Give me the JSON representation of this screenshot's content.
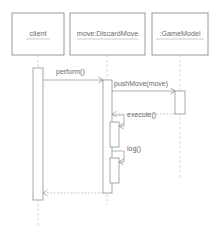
{
  "diagram": {
    "type": "uml-sequence-diagram",
    "title": "",
    "background_color": "#ffffff",
    "line_color": "#9e9e9e",
    "text_color": "#6b6b6b",
    "lifeline_color": "#c2c2c2",
    "participants": [
      {
        "id": "client",
        "label": "client",
        "underlined": true,
        "box": {
          "x": 12,
          "y": 13,
          "width": 52,
          "height": 42
        },
        "lifeline_x": 38,
        "activations": [
          {
            "x": 33,
            "y": 68,
            "width": 10,
            "height": 132
          }
        ]
      },
      {
        "id": "move-discard-move",
        "label": "move:DiscardMove",
        "underlined": true,
        "box": {
          "x": 70,
          "y": 13,
          "width": 75,
          "height": 42
        },
        "lifeline_x": 107,
        "activations": [
          {
            "x": 103,
            "y": 80,
            "width": 9,
            "height": 113
          },
          {
            "x": 110,
            "y": 122,
            "width": 9,
            "height": 25
          },
          {
            "x": 110,
            "y": 158,
            "width": 9,
            "height": 25
          }
        ]
      },
      {
        "id": "game-model",
        "label": ":GameModel",
        "underlined": true,
        "box": {
          "x": 152,
          "y": 13,
          "width": 56,
          "height": 42
        },
        "lifeline_x": 180,
        "activations": [
          {
            "x": 175,
            "y": 91,
            "width": 10,
            "height": 23
          }
        ]
      }
    ],
    "messages": [
      {
        "id": "msg-perform",
        "label": "perform()",
        "kind": "synchronous-call",
        "from": "client",
        "to": "move-discard-move",
        "direction": "right",
        "y": 80,
        "label_x": 56,
        "label_y": 72
      },
      {
        "id": "msg-pushmove",
        "label": "pushMove(move)",
        "kind": "synchronous-call",
        "from": "move-discard-move",
        "to": "game-model",
        "direction": "right",
        "y": 91,
        "label_x": 114,
        "label_y": 84
      },
      {
        "id": "msg-pushmove-return",
        "label": "",
        "kind": "return",
        "from": "game-model",
        "to": "move-discard-move",
        "direction": "left",
        "y": 114,
        "label_x": 0,
        "label_y": 0
      },
      {
        "id": "msg-execute",
        "label": "execute()",
        "kind": "self-call",
        "from": "move-discard-move",
        "to": "move-discard-move",
        "direction": "self",
        "y": 115,
        "label_x": 127,
        "label_y": 115
      },
      {
        "id": "msg-log",
        "label": "log()",
        "kind": "self-call",
        "from": "move-discard-move",
        "to": "move-discard-move",
        "direction": "self",
        "y": 151,
        "label_x": 127,
        "label_y": 149
      },
      {
        "id": "msg-perform-return",
        "label": "",
        "kind": "return",
        "from": "move-discard-move",
        "to": "client",
        "direction": "left",
        "y": 193,
        "label_x": 0,
        "label_y": 0
      }
    ]
  }
}
